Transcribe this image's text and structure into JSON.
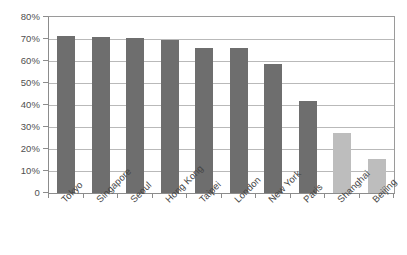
{
  "chart_data": {
    "type": "bar",
    "title": "",
    "subtitle": "",
    "xlabel": "",
    "ylabel": "",
    "categories": [
      "Tokyo",
      "Singapore",
      "Seoul",
      "Hong Kong",
      "Taipei",
      "London",
      "New York",
      "Paris",
      "Shanghai",
      "Beijing"
    ],
    "values": [
      71.5,
      71.0,
      70.5,
      69.5,
      66.0,
      66.0,
      58.5,
      42.0,
      27.5,
      15.5
    ],
    "series": [
      {
        "name": "",
        "values": [
          71.5,
          71.0,
          70.5,
          69.5,
          66.0,
          66.0,
          58.5,
          42.0,
          27.5,
          15.5
        ]
      }
    ],
    "bar_colors": [
      "#6e6e6e",
      "#6e6e6e",
      "#6e6e6e",
      "#6e6e6e",
      "#6e6e6e",
      "#6e6e6e",
      "#6e6e6e",
      "#6e6e6e",
      "#bdbdbd",
      "#bdbdbd"
    ],
    "ylim": [
      0,
      80
    ],
    "ytick_values": [
      0,
      10,
      20,
      30,
      40,
      50,
      60,
      70,
      80
    ],
    "ytick_labels": [
      "0",
      "10%",
      "20%",
      "30%",
      "40%",
      "50%",
      "60%",
      "70%",
      "80%"
    ],
    "grid": true,
    "grid_axis": "y",
    "legend": false,
    "legend_position": "none",
    "annotations": []
  },
  "style": {
    "background_color": "#ffffff",
    "plot_border_color": "#8c8c8c",
    "gridline_color": "#b9b9b9",
    "dark_bar_color": "#6e6e6e",
    "light_bar_color": "#bdbdbd",
    "tick_label_color": "#4f4f4f",
    "category_label_color": "#454545"
  }
}
